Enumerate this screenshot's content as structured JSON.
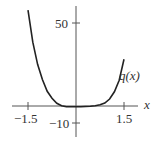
{
  "chart_data": {
    "type": "line",
    "title": "",
    "xlabel": "x",
    "ylabel": "",
    "series": [
      {
        "name": "q(x)",
        "x": [
          -1.5,
          -1.35,
          -1.2,
          -1.05,
          -0.9,
          -0.75,
          -0.6,
          -0.45,
          -0.3,
          -0.15,
          0,
          0.15,
          0.3,
          0.45,
          0.6,
          0.75,
          0.9,
          1.05,
          1.2,
          1.35,
          1.5
        ],
        "values": [
          57.5,
          38.3,
          25.0,
          15.9,
          8.8,
          4.6,
          1.6,
          0.2,
          -0.4,
          -0.5,
          -0.5,
          -0.5,
          -0.3,
          -0.1,
          0.2,
          0.8,
          1.8,
          4.2,
          8.5,
          15.5,
          28.0
        ]
      }
    ],
    "xticks": [
      -1.5,
      1.5
    ],
    "yticks": [
      -10,
      50
    ],
    "xlim": [
      -1.9,
      2.0
    ],
    "ylim": [
      -17,
      62
    ],
    "grid": false,
    "legend": "none",
    "annotations": [
      {
        "text": "q(x)",
        "x": 1.5,
        "y": 28
      }
    ]
  },
  "labels": {
    "x_axis": "x",
    "curve": "q(x)",
    "xtick_neg": "−1.5",
    "xtick_pos": "1.5",
    "ytick_top": "50",
    "ytick_bottom": "−10"
  }
}
